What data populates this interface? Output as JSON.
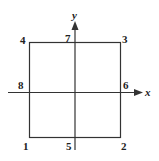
{
  "diagram": {
    "axes": {
      "x_label": "x",
      "y_label": "y"
    },
    "nodes": [
      {
        "id": "1",
        "label": "1",
        "position": "bottom-left corner"
      },
      {
        "id": "2",
        "label": "2",
        "position": "bottom-right corner"
      },
      {
        "id": "3",
        "label": "3",
        "position": "top-right corner"
      },
      {
        "id": "4",
        "label": "4",
        "position": "top-left corner"
      },
      {
        "id": "5",
        "label": "5",
        "position": "bottom edge midpoint"
      },
      {
        "id": "6",
        "label": "6",
        "position": "right edge midpoint"
      },
      {
        "id": "7",
        "label": "7",
        "position": "top edge midpoint"
      },
      {
        "id": "8",
        "label": "8",
        "position": "left edge midpoint"
      }
    ],
    "colors": {
      "line": "#333333",
      "text": "#222222"
    }
  }
}
